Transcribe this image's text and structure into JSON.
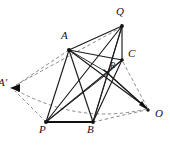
{
  "figure": {
    "background_color": "#ffffff",
    "line_color": "#111111",
    "dashed_color": "#7d7d7d",
    "width": 170,
    "height": 146,
    "vertices": [
      {
        "id": "Q",
        "label": "Q",
        "x": 122,
        "y": 26,
        "label_x": 116,
        "label_y": 8,
        "size": "normal"
      },
      {
        "id": "A",
        "label": "A",
        "x": 69,
        "y": 50,
        "label_x": 61,
        "label_y": 32,
        "size": "normal"
      },
      {
        "id": "C",
        "label": "C",
        "x": 122,
        "y": 60,
        "label_x": 128,
        "label_y": 50,
        "size": "normal"
      },
      {
        "id": "R",
        "label": "R",
        "x": 108,
        "y": 73,
        "label_x": 110,
        "label_y": 63,
        "size": "small"
      },
      {
        "id": "P",
        "label": "P",
        "x": 46,
        "y": 122,
        "label_x": 40,
        "label_y": 126,
        "size": "normal"
      },
      {
        "id": "B",
        "label": "B",
        "x": 93,
        "y": 122,
        "label_x": 88,
        "label_y": 126,
        "size": "normal"
      },
      {
        "id": "O",
        "label": "O",
        "x": 148,
        "y": 110,
        "label_x": 154,
        "label_y": 110,
        "size": "normal"
      },
      {
        "id": "A2",
        "label": "A'",
        "x": 11,
        "y": 88,
        "label_x": -1,
        "label_y": 78,
        "size": "normal"
      }
    ],
    "solid_edges": [
      {
        "from": "A",
        "to": "Q"
      },
      {
        "from": "A",
        "to": "C"
      },
      {
        "from": "A",
        "to": "R"
      },
      {
        "from": "A",
        "to": "P"
      },
      {
        "from": "A",
        "to": "B"
      },
      {
        "from": "A",
        "to": "O"
      },
      {
        "from": "Q",
        "to": "C"
      },
      {
        "from": "Q",
        "to": "R"
      },
      {
        "from": "Q",
        "to": "P"
      },
      {
        "from": "Q",
        "to": "B"
      },
      {
        "from": "C",
        "to": "R"
      },
      {
        "from": "C",
        "to": "P"
      },
      {
        "from": "C",
        "to": "B"
      },
      {
        "from": "R",
        "to": "P"
      },
      {
        "from": "R",
        "to": "B"
      }
    ],
    "base_edges": [
      {
        "from": "P",
        "to": "B"
      }
    ],
    "dashed_edges": [
      {
        "from": "A",
        "to": "A2"
      },
      {
        "from": "P",
        "to": "A2"
      },
      {
        "from": "O",
        "to": "A2"
      },
      {
        "from": "C",
        "to": "O"
      },
      {
        "from": "B",
        "to": "O"
      },
      {
        "from": "Q",
        "to": "A2"
      }
    ],
    "arrow_edges": [
      {
        "from": "R",
        "to": "O",
        "style": "solid"
      }
    ],
    "arrowheads": [
      {
        "at": "A2",
        "direction": "left"
      },
      {
        "at": "O",
        "direction": "down-right"
      }
    ]
  }
}
